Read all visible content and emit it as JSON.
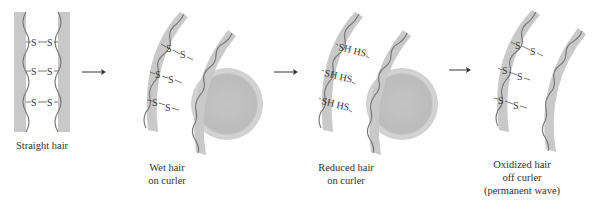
{
  "figure": {
    "panels": [
      {
        "id": "straight",
        "label_lines": [
          "Straight hair"
        ],
        "bonds": [
          "-S—S-",
          "-S—S-",
          "-S—S-"
        ],
        "bond_atoms": [
          [
            "S",
            "S"
          ],
          [
            "S",
            "S"
          ],
          [
            "S",
            "S"
          ]
        ],
        "has_curler": false
      },
      {
        "id": "wet",
        "label_lines": [
          "Wet hair",
          "on curler"
        ],
        "bond_atoms": [
          [
            "S",
            "S"
          ],
          [
            "S",
            "S"
          ],
          [
            "S",
            "S"
          ]
        ],
        "has_curler": true
      },
      {
        "id": "reduced",
        "label_lines": [
          "Reduced hair",
          "on curler"
        ],
        "bond_atoms": [
          [
            "SH",
            "HS"
          ],
          [
            "SH",
            "HS"
          ],
          [
            "SH",
            "HS"
          ]
        ],
        "has_curler": true
      },
      {
        "id": "oxidized",
        "label_lines": [
          "Oxidized hair",
          "off curler",
          "(permanent wave)"
        ],
        "bond_atoms": [
          [
            "S",
            "S"
          ],
          [
            "S",
            "S"
          ],
          [
            "S",
            "S"
          ]
        ],
        "has_curler": false
      }
    ],
    "arrows": [
      "arrow-1",
      "arrow-2",
      "arrow-3"
    ],
    "colors": {
      "strand_fill": "#c9c9c9",
      "wave_stroke": "#7a7a7a",
      "curler_fill": "#bdbdbd",
      "curler_rim": "#d6d6d6",
      "text": "#333333"
    }
  }
}
